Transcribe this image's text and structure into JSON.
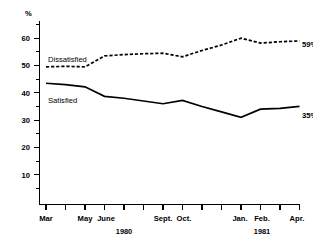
{
  "chart_data": {
    "type": "line",
    "title": "",
    "subtitle": "",
    "xlabel": "",
    "ylabel": "%",
    "ylim": [
      0,
      65
    ],
    "yticks": [
      10,
      20,
      30,
      40,
      50,
      60
    ],
    "ytick_labels": [
      "10",
      "20",
      "30",
      "40",
      "50",
      "60"
    ],
    "grid": false,
    "legend": "inline-labels",
    "x": [
      "Mar",
      "Apr",
      "May",
      "June",
      "July",
      "Aug",
      "Sept.",
      "Oct.",
      "Nov",
      "Dec",
      "Jan.",
      "Feb.",
      "Mar",
      "Apr."
    ],
    "xtick_labels_shown": [
      "Mar",
      "May",
      "June",
      "Sept.",
      "Oct.",
      "Jan.",
      "Feb.",
      "Apr."
    ],
    "year_groups": [
      {
        "label": "1980",
        "start": "Mar",
        "end": "Dec"
      },
      {
        "label": "1981",
        "start": "Jan.",
        "end": "Apr."
      }
    ],
    "series": [
      {
        "name": "Dissatisfied",
        "style": "dashed",
        "end_value_label": "59%",
        "values": [
          49.5,
          49.7,
          49.5,
          53.5,
          54.0,
          54.3,
          54.5,
          53.2,
          55.5,
          57.5,
          60.0,
          58.2,
          58.7,
          59.0
        ]
      },
      {
        "name": "Satisfied",
        "style": "solid",
        "end_value_label": "35%",
        "values": [
          43.5,
          43.0,
          42.2,
          38.7,
          38.0,
          37.0,
          36.0,
          37.2,
          35.0,
          33.0,
          31.0,
          34.0,
          34.3,
          35.0
        ]
      }
    ],
    "annotations": [
      {
        "text": "Dissatisfied",
        "series": "Dissatisfied"
      },
      {
        "text": "Satisfied",
        "series": "Satisfied"
      },
      {
        "text": "59%",
        "series": "Dissatisfied",
        "kind": "end-value"
      },
      {
        "text": "35%",
        "series": "Satisfied",
        "kind": "end-value"
      }
    ]
  },
  "axis": {
    "unit": "%",
    "y_ticks": [
      "60",
      "50",
      "40",
      "30",
      "20",
      "10"
    ],
    "x_ticks": [
      "Mar",
      "May",
      "June",
      "Sept.",
      "Oct.",
      "Jan.",
      "Feb.",
      "Apr."
    ],
    "years": [
      "1980",
      "1981"
    ]
  },
  "labels": {
    "dissatisfied": "Dissatisfied",
    "satisfied": "Satisfied",
    "dissatisfied_end": "59%",
    "satisfied_end": "35%"
  },
  "colors": {
    "ink": "#000000",
    "background": "#ffffff"
  }
}
